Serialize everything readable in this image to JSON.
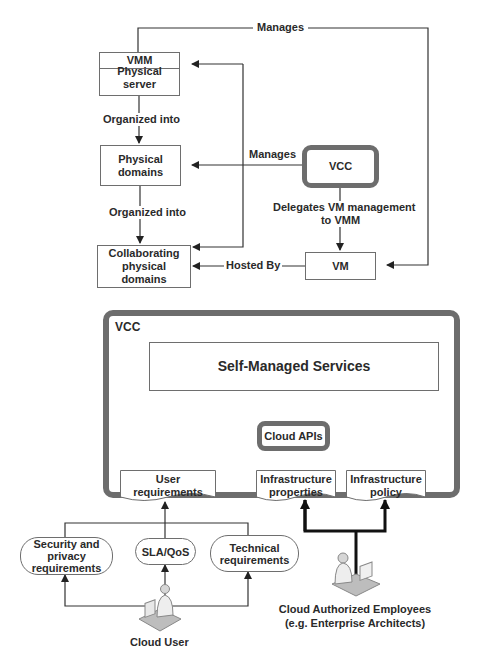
{
  "top_diagram": {
    "vmm_box": {
      "header": "VMM",
      "body": "Physical server"
    },
    "physical_domains": "Physical domains",
    "collaborating_domains": "Collaborating physical domains",
    "vcc": "VCC",
    "vm": "VM",
    "edges": {
      "manages_top": "Manages",
      "organized_into_1": "Organized into",
      "organized_into_2": "Organized into",
      "manages_vcc": "Manages",
      "delegates_line1": "Delegates VM management",
      "delegates_line2": "to VMM",
      "hosted_by": "Hosted By"
    }
  },
  "bottom_diagram": {
    "container_title": "VCC",
    "self_managed_services": "Self-Managed Services",
    "cloud_apis": "Cloud APIs",
    "documents": [
      {
        "line1": "User",
        "line2": "requirements"
      },
      {
        "line1": "Infrastructure",
        "line2": "properties"
      },
      {
        "line1": "Infrastructure",
        "line2": "policy"
      }
    ],
    "requirements": [
      {
        "line1": "Security and",
        "line2": "privacy",
        "line3": "requirements"
      },
      {
        "line1": "SLA/QoS"
      },
      {
        "line1": "Technical",
        "line2": "requirements"
      }
    ],
    "actors": {
      "cloud_user": "Cloud User",
      "employees_line1": "Cloud Authorized Employees",
      "employees_line2": "(e.g. Enterprise Architects)"
    }
  },
  "colors": {
    "line": "#333333",
    "box_border": "#6e6e6e",
    "thick_border": "#6d6d6d"
  }
}
